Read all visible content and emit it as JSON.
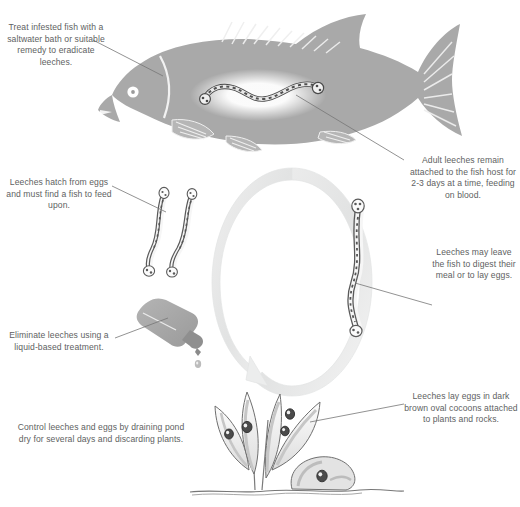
{
  "diagram": {
    "type": "illustrated-life-cycle",
    "background_color": "#ffffff",
    "text_color": "#5e5f62",
    "illustration_gray": "#a9a9a9",
    "ring_color": "#e9eaea"
  },
  "captions": {
    "treat": "Treat infested fish with a saltwater bath or suitable remedy to eradicate leeches.",
    "adult": "Adult leeches remain attached to the fish host for 2-3 days at a time, feeding on blood.",
    "hatch": "Leeches hatch from eggs and must find a fish to feed upon.",
    "leave": "Leeches may leave the fish to digest their meal or to lay eggs.",
    "eliminate": "Eliminate leeches using a liquid-based treatment.",
    "control": "Control leeches and eggs by draining pond dry for several days and discarding plants.",
    "lay": "Leeches lay eggs in dark brown oval cocoons attached to plants and rocks."
  },
  "figures": {
    "fish": "fish-with-attached-leech",
    "ring": "life-cycle-ring-arrow",
    "juvenile_leeches": "two-juvenile-leeches",
    "adult_leech": "single-adult-leech",
    "dropper": "liquid-treatment-dropper-bottle",
    "plants": "aquatic-plants-and-rock-with-egg-cocoons"
  }
}
